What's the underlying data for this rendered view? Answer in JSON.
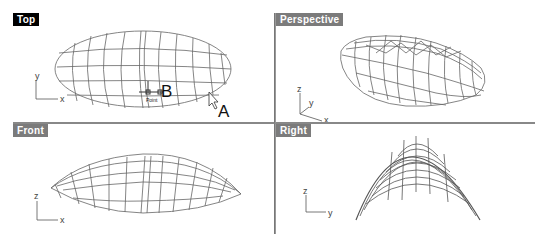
{
  "viewports": [
    {
      "name": "Top",
      "active": true,
      "axes": [
        "y",
        "x"
      ]
    },
    {
      "name": "Perspective",
      "active": false,
      "axes": [
        "z",
        "y",
        "x"
      ]
    },
    {
      "name": "Front",
      "active": false,
      "axes": [
        "z",
        "x"
      ]
    },
    {
      "name": "Right",
      "active": false,
      "axes": [
        "z",
        "y"
      ]
    }
  ],
  "annotations": {
    "point_label": "Point",
    "label_a": "A",
    "label_b": "B"
  },
  "colors": {
    "active_tab": "#000000",
    "inactive_tab": "#7b7b7b",
    "frame": "#7a7a7a",
    "wireframe": "#555555"
  }
}
